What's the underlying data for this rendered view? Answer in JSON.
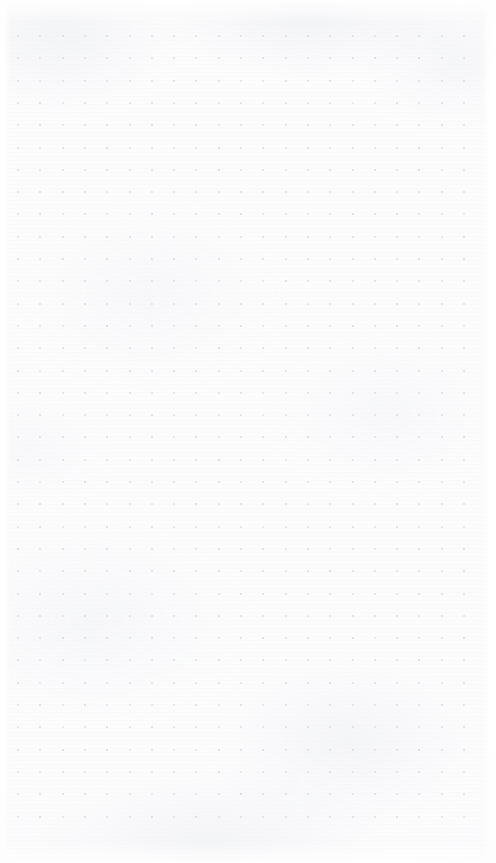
{
  "canvas": {
    "title": "Untitled",
    "state_label": "Empty dot grid page",
    "background_color": "#fcfcfd",
    "paper_tint_color": "#e6e8ec",
    "dot_color": "#d9dade",
    "dot_size_px": 2,
    "grid": {
      "pitch_px": 22.3,
      "origin_x_px": 18,
      "origin_y_px": 36,
      "columns": 21,
      "rows": 36,
      "dot_count": 756
    },
    "margins": {
      "left_px": 10,
      "right_px": 14,
      "top_px": 22,
      "bottom_px": 20
    },
    "page": {
      "width_px": 496,
      "height_px": 863
    }
  },
  "content": {
    "items": [],
    "empty_message": ""
  }
}
